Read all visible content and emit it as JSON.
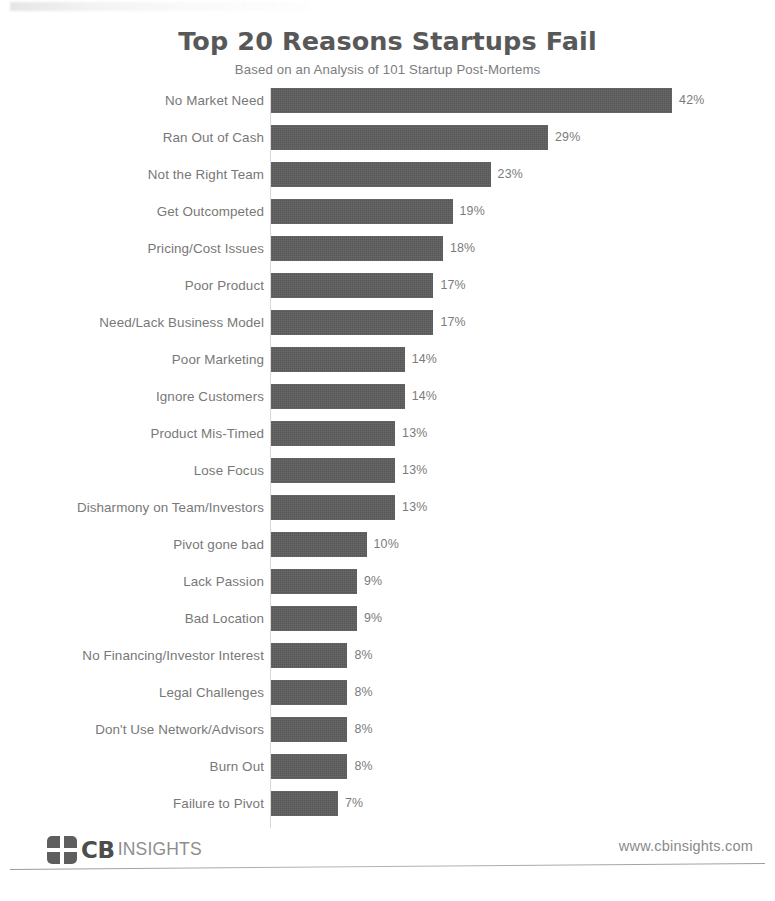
{
  "chart_data": {
    "type": "bar",
    "orientation": "horizontal",
    "title": "Top 20 Reasons Startups Fail",
    "subtitle": "Based on an Analysis of 101 Startup Post-Mortems",
    "xlabel": "",
    "ylabel": "",
    "xlim": [
      0,
      42
    ],
    "grid": false,
    "legend": null,
    "value_suffix": "%",
    "bar_color": "#5c5c5c",
    "label_color": "#787878",
    "categories": [
      "No Market Need",
      "Ran Out of Cash",
      "Not the Right Team",
      "Get Outcompeted",
      "Pricing/Cost Issues",
      "Poor Product",
      "Need/Lack Business Model",
      "Poor Marketing",
      "Ignore Customers",
      "Product Mis-Timed",
      "Lose Focus",
      "Disharmony on Team/Investors",
      "Pivot gone bad",
      "Lack Passion",
      "Bad Location",
      "No Financing/Investor Interest",
      "Legal Challenges",
      "Don't Use Network/Advisors",
      "Burn Out",
      "Failure to Pivot"
    ],
    "values": [
      42,
      29,
      23,
      19,
      18,
      17,
      17,
      14,
      14,
      13,
      13,
      13,
      10,
      9,
      9,
      8,
      8,
      8,
      8,
      7
    ],
    "value_labels": [
      "42%",
      "29%",
      "23%",
      "19%",
      "18%",
      "17%",
      "17%",
      "14%",
      "14%",
      "13%",
      "13%",
      "13%",
      "10%",
      "9%",
      "9%",
      "8%",
      "8%",
      "8%",
      "8%",
      "7%"
    ]
  },
  "footer": {
    "logo_cb": "CB",
    "logo_insights": "INSIGHTS",
    "site_url": "www.cbinsights.com"
  }
}
